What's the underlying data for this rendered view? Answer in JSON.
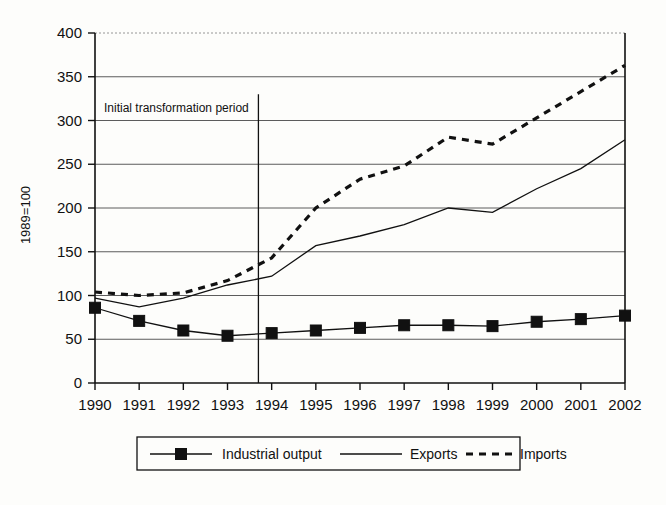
{
  "chart_data": {
    "type": "line",
    "title": "",
    "xlabel": "",
    "ylabel": "1989=100",
    "ylim": [
      0,
      400
    ],
    "ytick_values": [
      0,
      50,
      100,
      150,
      200,
      250,
      300,
      350,
      400
    ],
    "ytick_labels": [
      "0",
      "50",
      "100",
      "150",
      "200",
      "250",
      "300",
      "350",
      "400"
    ],
    "grid": true,
    "legend_position": "bottom",
    "categories": [
      "1990",
      "1991",
      "1992",
      "1993",
      "1994",
      "1995",
      "1996",
      "1997",
      "1998",
      "1999",
      "2000",
      "2001",
      "2002"
    ],
    "x": [
      1990,
      1991,
      1992,
      1993,
      1994,
      1995,
      1996,
      1997,
      1998,
      1999,
      2000,
      2001,
      2002
    ],
    "series": [
      {
        "name": "Industrial output",
        "marker": "filled-square",
        "linestyle": "solid",
        "values": [
          86,
          71,
          60,
          54,
          57,
          60,
          63,
          66,
          66,
          65,
          70,
          73,
          77
        ]
      },
      {
        "name": "Exports",
        "marker": "none",
        "linestyle": "solid",
        "values": [
          97,
          87,
          97,
          112,
          122,
          157,
          168,
          181,
          200,
          195,
          222,
          245,
          278
        ]
      },
      {
        "name": "Imports",
        "marker": "none",
        "linestyle": "dashed",
        "values": [
          104,
          100,
          103,
          117,
          143,
          200,
          233,
          248,
          281,
          273,
          303,
          333,
          363
        ]
      }
    ],
    "annotations": [
      {
        "name": "initial-transformation-period",
        "text": "Initial transformation period",
        "x_value": 1993.7,
        "type": "vertical-line-with-label"
      }
    ],
    "legend_entries": [
      {
        "label": "Industrial output",
        "sample": "line-with-square-marker"
      },
      {
        "label": "Exports",
        "sample": "solid-line"
      },
      {
        "label": "Imports",
        "sample": "dashed-line"
      }
    ],
    "colors": {
      "series_industrial_output": "#111111",
      "series_exports": "#111111",
      "series_imports": "#111111",
      "grid": "#4a4a4a",
      "axis": "#111111",
      "background": "#fdfdfb"
    }
  }
}
